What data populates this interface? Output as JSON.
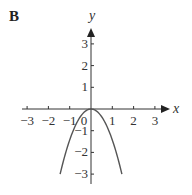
{
  "panel_label": "B",
  "chart_data": {
    "type": "line",
    "title": "",
    "xlabel": "x",
    "ylabel": "y",
    "xlim": [
      -3.3,
      3.6
    ],
    "ylim": [
      -3.4,
      3.8
    ],
    "grid": false,
    "legend": null,
    "x_ticks": [
      -3,
      -2,
      -1,
      0,
      1,
      2,
      3
    ],
    "x_tick_labels": [
      "−3",
      "−2",
      "−1",
      "0",
      "1",
      "2",
      "3"
    ],
    "y_ticks": [
      -3,
      -2,
      -1,
      1,
      2,
      3
    ],
    "y_tick_labels": [
      "−3",
      "−2",
      "−1",
      "1",
      "2",
      "3"
    ],
    "series": [
      {
        "name": "downward parabola",
        "description": "Parabola opening downward with vertex at origin",
        "x": [
          -1.45,
          -1.0,
          -0.5,
          0,
          0.5,
          1.0,
          1.45
        ],
        "y": [
          -3.0,
          -1.4,
          -0.35,
          0,
          -0.35,
          -1.4,
          -3.0
        ]
      }
    ]
  }
}
